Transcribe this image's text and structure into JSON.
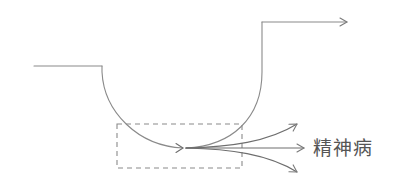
{
  "diagram": {
    "label": "精神病",
    "colors": {
      "line": "#8a8a8a",
      "line_dark": "#6e6e6e",
      "text": "#555555",
      "background": "#ffffff"
    },
    "elements": [
      {
        "id": "left-baseline",
        "type": "line",
        "description": "horizontal baseline on the left"
      },
      {
        "id": "descent-curve",
        "type": "curve",
        "description": "curve dropping down into a trough"
      },
      {
        "id": "ascent-curve",
        "type": "curve",
        "description": "curve rising out of the trough to a high vertical"
      },
      {
        "id": "top-arrow",
        "type": "arrow",
        "description": "top horizontal arrow pointing right"
      },
      {
        "id": "focus-box",
        "type": "dashed-rectangle",
        "description": "dashed box highlighting the trough"
      },
      {
        "id": "divergent-arrows",
        "type": "arrows",
        "count": 3,
        "description": "three diverging arrows pointing toward the label"
      }
    ]
  }
}
